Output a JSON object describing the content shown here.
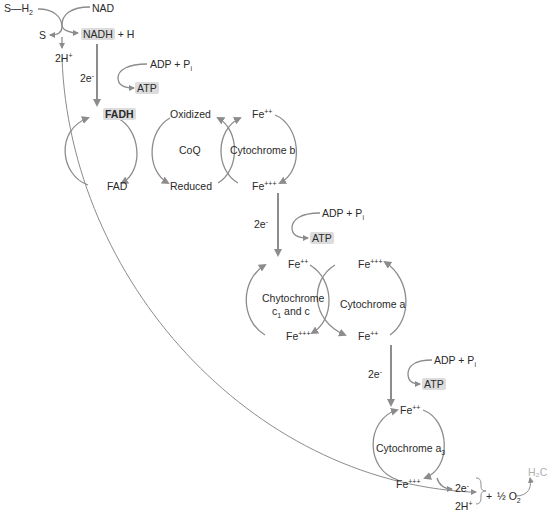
{
  "diagram": {
    "type": "electron-transport-chain",
    "colors": {
      "arrow": "#8c8c8c",
      "text": "#2a2a2a",
      "highlight": "#dcdcdc",
      "faint": "#b0b0b0"
    },
    "start": {
      "substrate": "S—H",
      "substrate_sub": "2",
      "oxidized_substrate": "S",
      "nad": "NAD",
      "nadh": "NADH",
      "plus_h": "+ H",
      "protons": "2H",
      "protons_sup": "+"
    },
    "atp_sites": [
      {
        "adp": "ADP + P",
        "adp_sub": "i",
        "atp": "ATP",
        "electrons": "2e",
        "electrons_sup": "-"
      },
      {
        "adp": "ADP + P",
        "adp_sub": "i",
        "atp": "ATP",
        "electrons": "2e",
        "electrons_sup": "-"
      },
      {
        "adp": "ADP + P",
        "adp_sub": "i",
        "atp": "ATP",
        "electrons": "2e",
        "electrons_sup": "-"
      }
    ],
    "flavoprotein": {
      "reduced": "FADH",
      "oxidized": "FAD"
    },
    "coq": {
      "name": "CoQ",
      "oxidized": "Oxidized",
      "reduced": "Reduced"
    },
    "cyt_b": {
      "name": "Cytochrome b",
      "top": "Fe",
      "top_sup": "++",
      "bottom": "Fe",
      "bottom_sup": "+++"
    },
    "cyt_c": {
      "name_line1": "Chytochrome",
      "name_line2_pre": "c",
      "name_line2_sub": "1",
      "name_line2_post": " and c",
      "top": "Fe",
      "top_sup": "++",
      "bottom": "Fe",
      "bottom_sup": "+++"
    },
    "cyt_a": {
      "name": "Cytochrome a",
      "top": "Fe",
      "top_sup": "+++",
      "bottom": "Fe",
      "bottom_sup": "++"
    },
    "cyt_a3": {
      "name": "Cytochrome a",
      "name_sub": "3",
      "top": "Fe",
      "top_sup": "++",
      "bottom": "Fe",
      "bottom_sup": "+++"
    },
    "final": {
      "electrons": "2e",
      "electrons_sup": "-",
      "protons": "2H",
      "protons_sup": "+",
      "plus": "+",
      "oxygen": "½ O",
      "oxygen_sub": "2",
      "water": "H₂C"
    }
  }
}
